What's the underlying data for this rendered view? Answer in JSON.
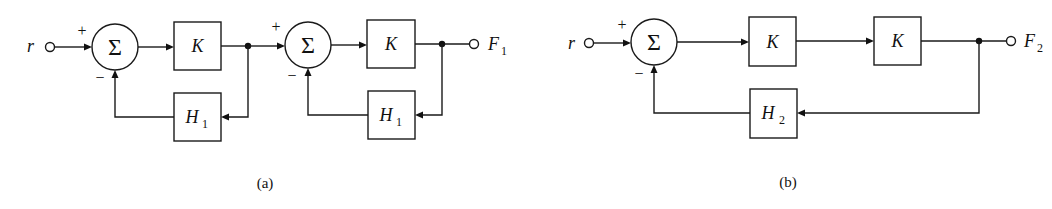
{
  "diagrams": [
    {
      "caption": "(a)",
      "input_label": "r",
      "output_label": "F",
      "output_subscript": "1",
      "stages": [
        {
          "sum_symbol": "Σ",
          "plus_sign": "+",
          "minus_sign": "−",
          "forward_block": "K",
          "feedback_block": "H",
          "feedback_subscript": "1"
        },
        {
          "sum_symbol": "Σ",
          "plus_sign": "+",
          "minus_sign": "−",
          "forward_block": "K",
          "feedback_block": "H",
          "feedback_subscript": "1"
        }
      ]
    },
    {
      "caption": "(b)",
      "input_label": "r",
      "output_label": "F",
      "output_subscript": "2",
      "sum_symbol": "Σ",
      "plus_sign": "+",
      "minus_sign": "−",
      "forward_blocks": [
        "K",
        "K"
      ],
      "feedback_block": "H",
      "feedback_subscript": "2"
    }
  ]
}
